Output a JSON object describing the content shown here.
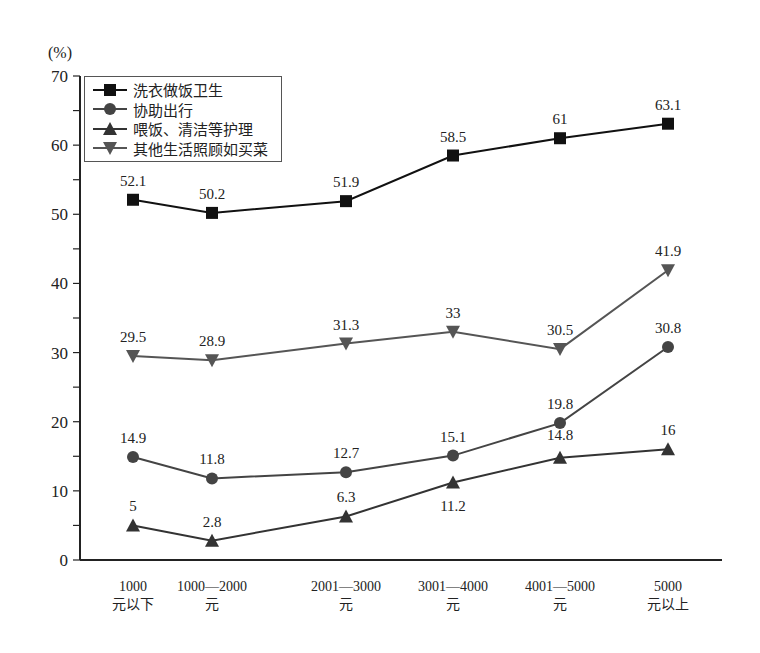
{
  "chart_data": {
    "type": "line",
    "title": "",
    "ylabel": "(%)",
    "xlabel": "",
    "ylim": [
      0,
      70
    ],
    "yticks": [
      0,
      10,
      20,
      30,
      40,
      50,
      60,
      70
    ],
    "grid": false,
    "legend_position": "top-left inside",
    "categories": [
      "1000元以下",
      "1000—2000元",
      "2001—3000元",
      "3001—4000元",
      "4001—5000元",
      "5000元以上"
    ],
    "category_lines": [
      [
        "1000",
        "元以下"
      ],
      [
        "1000—2000",
        "元"
      ],
      [
        "2001—3000",
        "元"
      ],
      [
        "3001—4000",
        "元"
      ],
      [
        "4001—5000",
        "元"
      ],
      [
        "5000",
        "元以上"
      ]
    ],
    "series": [
      {
        "name": "洗衣做饭卫生",
        "marker": "square",
        "color": "#111111",
        "values": [
          52.1,
          50.2,
          51.9,
          58.5,
          61,
          63.1
        ]
      },
      {
        "name": "协助出行",
        "marker": "circle",
        "color": "#444444",
        "values": [
          14.9,
          11.8,
          12.7,
          15.1,
          19.8,
          30.8
        ]
      },
      {
        "name": "喂饭、清洁等护理",
        "marker": "triangle-up",
        "color": "#333333",
        "values": [
          5,
          2.8,
          6.3,
          11.2,
          14.8,
          16
        ]
      },
      {
        "name": "其他生活照顾如买菜",
        "marker": "triangle-down",
        "color": "#555555",
        "values": [
          29.5,
          28.9,
          31.3,
          33,
          30.5,
          41.9
        ]
      }
    ]
  }
}
